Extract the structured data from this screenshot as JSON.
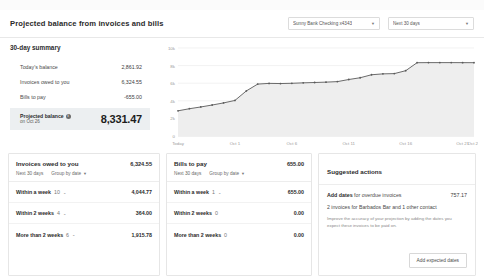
{
  "header": {
    "title": "Projected balance from invoices and bills",
    "account_select": {
      "label": "Sunny Bank Checking x4343",
      "caret": "caret-down-icon"
    },
    "range_select": {
      "label": "Next 30 days",
      "caret": "caret-down-icon"
    }
  },
  "summary": {
    "title": "30-day summary",
    "rows": [
      {
        "label": "Today's balance",
        "amount": "2,861.92"
      },
      {
        "label": "Invoices owed to you",
        "amount": "6,324.55"
      },
      {
        "label": "Bills to pay",
        "amount": "-655.00"
      }
    ],
    "projected": {
      "label": "Projected balance",
      "info_icon": "info-icon",
      "sublabel": "on Oct 26",
      "amount": "8,331.47"
    }
  },
  "chart_data": {
    "type": "area",
    "title": "Projected balance from invoices and bills",
    "xlabel": "",
    "ylabel": "",
    "grid": true,
    "legend": "none",
    "ylim": [
      0,
      10000
    ],
    "ytick_labels": [
      "10k",
      "8k",
      "6k",
      "4k",
      "2k",
      "0"
    ],
    "ytick_values": [
      10000,
      8000,
      6000,
      4000,
      2000,
      0
    ],
    "xtick_labels": [
      "Today",
      "Oct 1",
      "Oct 6",
      "Oct 11",
      "Oct 16",
      "Oct 21",
      "Oct 26"
    ],
    "xtick_indices": [
      0,
      5,
      10,
      15,
      20,
      25,
      30
    ],
    "series": [
      {
        "name": "Projected balance",
        "color": "#5a5a5a",
        "fill": "#eeeeee",
        "x": [
          "Today",
          "Oct 1",
          "Oct 2",
          "Oct 3",
          "Oct 4",
          "Oct 5",
          "Oct 6",
          "Oct 7",
          "Oct 8",
          "Oct 9",
          "Oct 10",
          "Oct 11",
          "Oct 12",
          "Oct 13",
          "Oct 14",
          "Oct 15",
          "Oct 16",
          "Oct 17",
          "Oct 18",
          "Oct 19",
          "Oct 20",
          "Oct 21",
          "Oct 22",
          "Oct 23",
          "Oct 24",
          "Oct 25",
          "Oct 26"
        ],
        "values": [
          2861.92,
          3100,
          3300,
          3520,
          3760,
          4040,
          5120,
          5900,
          5980,
          5960,
          5990,
          6040,
          6080,
          6120,
          6180,
          6420,
          6620,
          6960,
          7060,
          7090,
          7420,
          8330,
          8340,
          8340,
          8340,
          8335,
          8331.47
        ]
      }
    ]
  },
  "cards": {
    "owed": {
      "title": "Invoices owed to you",
      "total": "6,324.55",
      "range_label": "Next 30 days",
      "group_label": "Group by date",
      "group_caret": "caret-down-icon",
      "rows": [
        {
          "label": "Within a week",
          "count": "10",
          "chevron": "chevron-down-icon",
          "amount": "4,044.77"
        },
        {
          "label": "Within 2 weeks",
          "count": "4",
          "chevron": "chevron-down-icon",
          "amount": "364.00"
        },
        {
          "label": "More than 2 weeks",
          "count": "6",
          "chevron": "chevron-down-icon",
          "amount": "1,915.78"
        }
      ]
    },
    "bills": {
      "title": "Bills to pay",
      "total": "655.00",
      "range_label": "Next 30 days",
      "group_label": "Group by date",
      "group_caret": "caret-down-icon",
      "rows": [
        {
          "label": "Within a week",
          "count": "1",
          "chevron": "chevron-down-icon",
          "amount": "655.00"
        },
        {
          "label": "Within 2 weeks",
          "count": "0",
          "chevron": "",
          "amount": "0.00"
        },
        {
          "label": "More than 2 weeks",
          "count": "0",
          "chevron": "",
          "amount": "0.00"
        }
      ]
    },
    "suggested": {
      "title": "Suggested actions",
      "action_bold": "Add dates",
      "action_rest": "for overdue invoices",
      "action_amount": "757.17",
      "detail": "2 invoices for Barbados Bar and 1 other contact",
      "fine_print": "Improve the accuracy of your projection by adding the dates you expect these invoices to be paid on.",
      "button_label": "Add expected dates"
    }
  }
}
